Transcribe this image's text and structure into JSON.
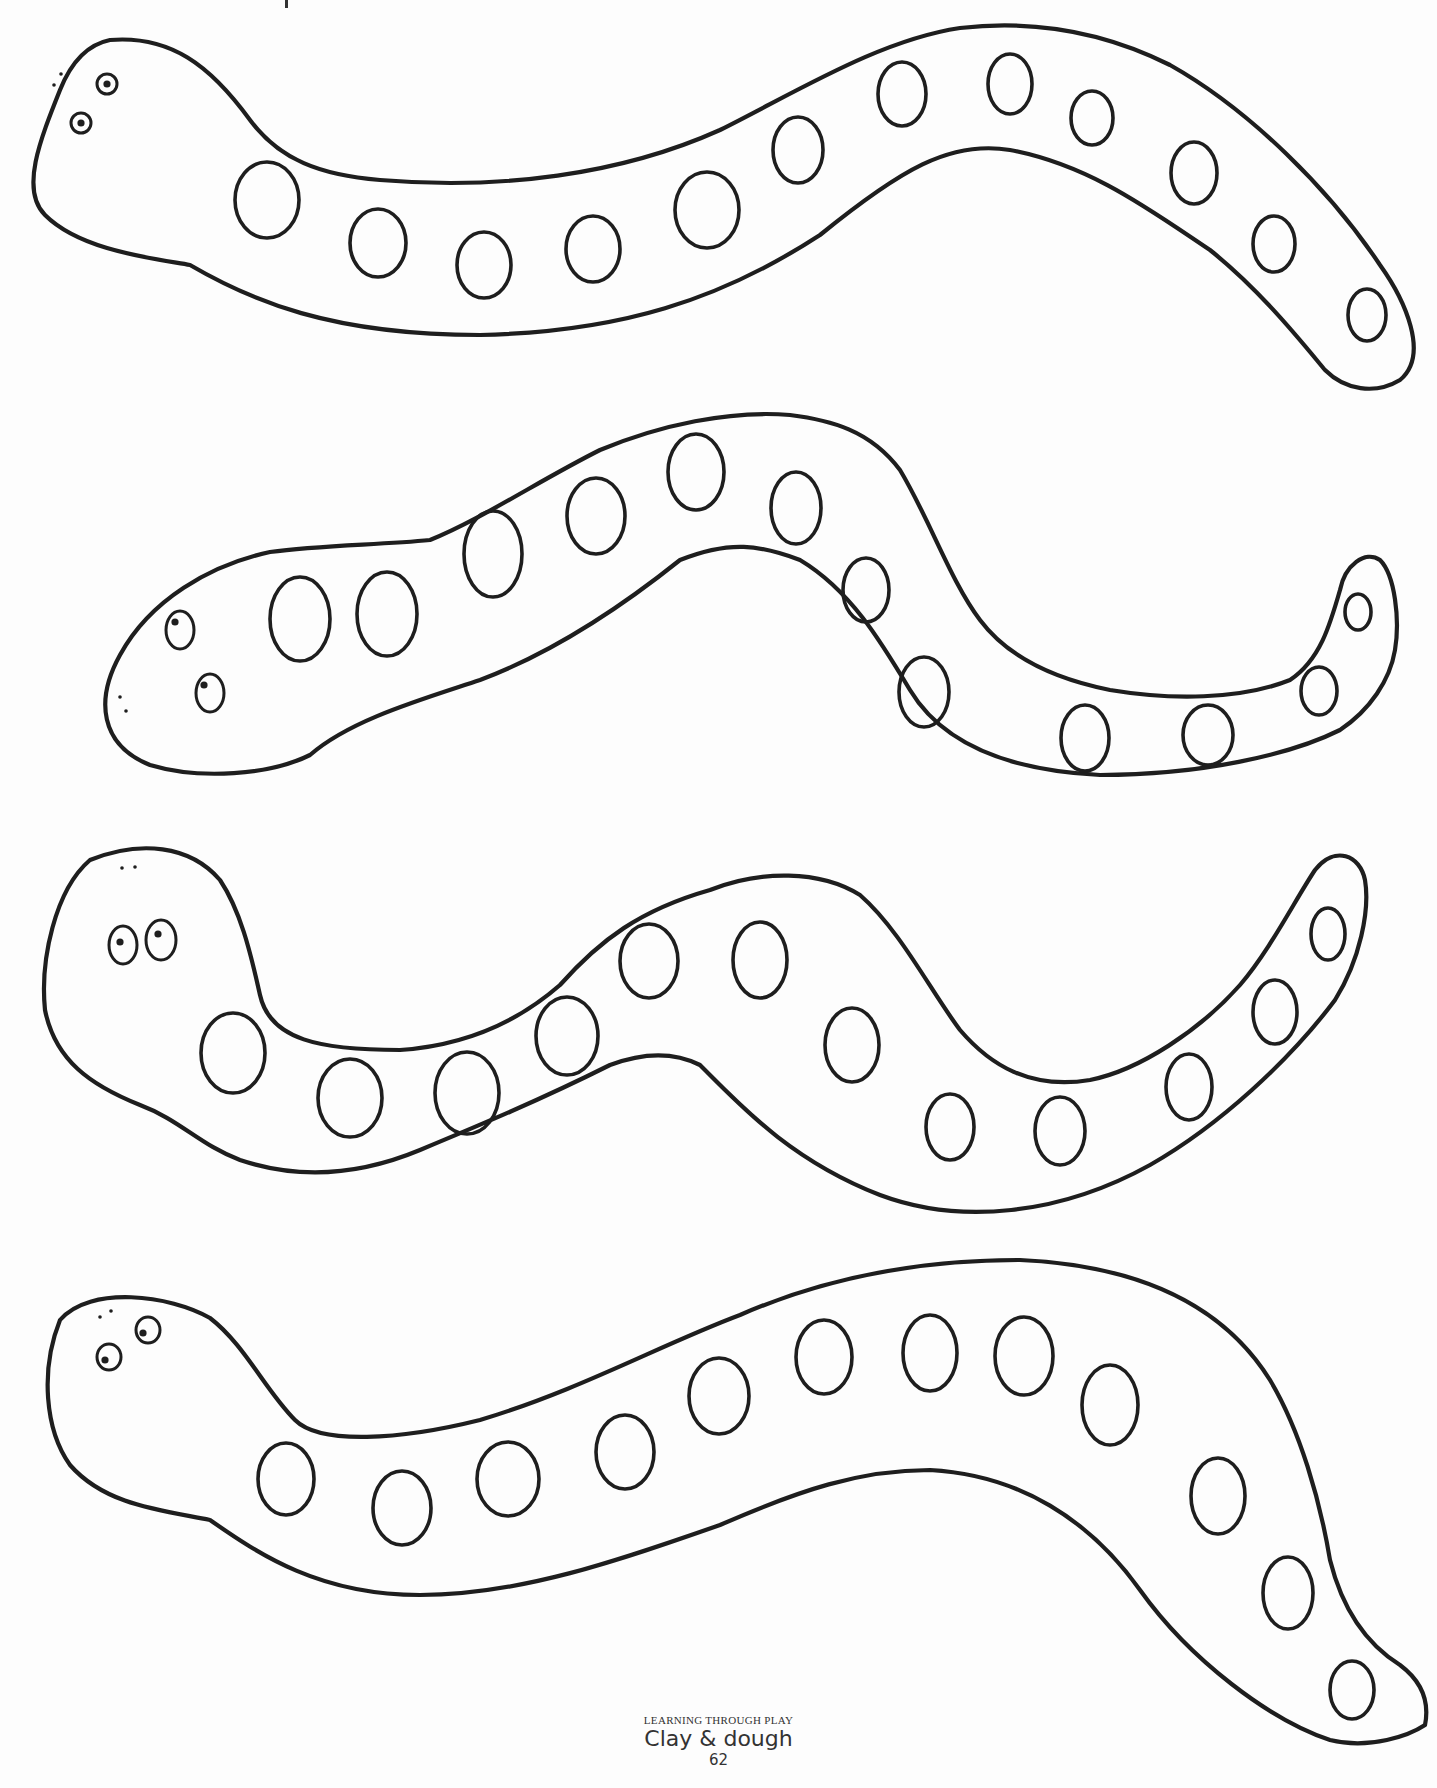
{
  "page": {
    "width": 1437,
    "height": 1788,
    "background": "#fdfdfd",
    "ink_color": "#1e1e1e"
  },
  "footer": {
    "series": "LEARNING THROUGH PLAY",
    "title": "Clay & dough",
    "page_number": "62"
  },
  "snakes": [
    {
      "id": "snake-1",
      "outline": "M 60 90 C 40 140, 20 190, 45 215 C 80 250, 150 258, 190 265 C 250 300, 330 335, 480 335 C 620 332, 720 300, 820 235 C 900 170, 950 140, 1010 150 C 1090 165, 1150 210, 1210 250 C 1260 290, 1300 340, 1325 370 C 1345 390, 1375 395, 1400 380 C 1430 355, 1405 300, 1380 265 C 1330 190, 1250 110, 1170 65 C 1100 30, 1030 20, 960 28 C 880 40, 800 90, 720 130 C 620 175, 500 190, 380 180 C 320 175, 280 160, 250 120 C 210 65, 170 35, 110 40 C 85 45, 70 65, 60 90 Z",
      "eyes": [
        {
          "cx": 107,
          "cy": 84,
          "rx": 10,
          "ry": 10,
          "pupil_dx": 0,
          "pupil_dy": 0
        },
        {
          "cx": 81,
          "cy": 123,
          "rx": 10,
          "ry": 10,
          "pupil_dx": 0,
          "pupil_dy": 0
        }
      ],
      "nostrils": [
        {
          "x": 61,
          "y": 74
        },
        {
          "x": 54,
          "y": 85
        }
      ],
      "spots": [
        {
          "cx": 267,
          "cy": 200,
          "rx": 32,
          "ry": 38
        },
        {
          "cx": 378,
          "cy": 243,
          "rx": 28,
          "ry": 34
        },
        {
          "cx": 484,
          "cy": 265,
          "rx": 27,
          "ry": 33
        },
        {
          "cx": 593,
          "cy": 249,
          "rx": 27,
          "ry": 33
        },
        {
          "cx": 707,
          "cy": 210,
          "rx": 32,
          "ry": 38
        },
        {
          "cx": 798,
          "cy": 150,
          "rx": 25,
          "ry": 33
        },
        {
          "cx": 902,
          "cy": 94,
          "rx": 24,
          "ry": 32
        },
        {
          "cx": 1010,
          "cy": 84,
          "rx": 22,
          "ry": 30
        },
        {
          "cx": 1092,
          "cy": 118,
          "rx": 21,
          "ry": 27
        },
        {
          "cx": 1194,
          "cy": 173,
          "rx": 23,
          "ry": 31
        },
        {
          "cx": 1274,
          "cy": 244,
          "rx": 21,
          "ry": 28
        },
        {
          "cx": 1367,
          "cy": 315,
          "rx": 19,
          "ry": 26
        }
      ]
    },
    {
      "id": "snake-2",
      "outline": "M 120 655 C 95 700, 100 745, 150 765 C 200 780, 270 775, 310 755 C 350 720, 420 700, 480 680 C 560 650, 630 600, 680 560 C 730 540, 760 545, 800 560 C 850 590, 880 640, 910 690 C 940 740, 1000 770, 1100 775 C 1200 775, 1290 755, 1340 730 C 1370 710, 1390 680, 1395 650 C 1400 620, 1395 575, 1380 560 C 1365 550, 1345 565, 1340 590 C 1330 625, 1320 660, 1290 680 C 1240 700, 1170 700, 1110 690 C 1060 680, 1010 660, 980 620 C 950 580, 930 520, 900 470 C 870 430, 830 420, 790 415 C 730 410, 660 425, 600 450 C 540 480, 480 520, 430 540 C 380 545, 320 545, 270 552 C 210 565, 150 600, 120 655 Z",
      "eyes": [
        {
          "cx": 180,
          "cy": 630,
          "rx": 14,
          "ry": 19,
          "pupil_dx": -5,
          "pupil_dy": -8
        },
        {
          "cx": 210,
          "cy": 693,
          "rx": 14,
          "ry": 19,
          "pupil_dx": -6,
          "pupil_dy": -8
        }
      ],
      "nostrils": [
        {
          "x": 120,
          "y": 697
        },
        {
          "x": 126,
          "y": 711
        }
      ],
      "spots": [
        {
          "cx": 300,
          "cy": 619,
          "rx": 30,
          "ry": 42
        },
        {
          "cx": 387,
          "cy": 614,
          "rx": 30,
          "ry": 42
        },
        {
          "cx": 493,
          "cy": 554,
          "rx": 29,
          "ry": 43
        },
        {
          "cx": 596,
          "cy": 516,
          "rx": 29,
          "ry": 38
        },
        {
          "cx": 696,
          "cy": 472,
          "rx": 28,
          "ry": 38
        },
        {
          "cx": 796,
          "cy": 508,
          "rx": 25,
          "ry": 36
        },
        {
          "cx": 866,
          "cy": 590,
          "rx": 23,
          "ry": 32
        },
        {
          "cx": 924,
          "cy": 692,
          "rx": 25,
          "ry": 35
        },
        {
          "cx": 1085,
          "cy": 738,
          "rx": 24,
          "ry": 33
        },
        {
          "cx": 1208,
          "cy": 735,
          "rx": 25,
          "ry": 30
        },
        {
          "cx": 1319,
          "cy": 691,
          "rx": 18,
          "ry": 24
        },
        {
          "cx": 1358,
          "cy": 612,
          "rx": 13,
          "ry": 18
        }
      ]
    },
    {
      "id": "snake-3",
      "outline": "M 90 860 C 55 890, 40 960, 45 1010 C 55 1060, 90 1085, 140 1105 C 180 1120, 200 1145, 240 1160 C 300 1180, 360 1175, 420 1150 C 480 1125, 540 1100, 610 1065 C 650 1050, 680 1055, 700 1065 C 740 1105, 790 1160, 880 1195 C 960 1225, 1060 1215, 1150 1165 C 1220 1125, 1290 1060, 1335 1000 C 1360 960, 1370 910, 1365 880 C 1360 855, 1335 845, 1315 870 C 1295 900, 1270 950, 1240 985 C 1200 1030, 1140 1070, 1090 1080 C 1030 1090, 990 1065, 960 1030 C 930 990, 900 930, 860 895 C 820 870, 760 870, 710 890 C 640 910, 600 940, 560 985 C 520 1020, 470 1045, 400 1050 C 320 1050, 270 1040, 260 995 C 250 950, 240 910, 220 880 C 190 845, 140 840, 90 860 Z",
      "eyes": [
        {
          "cx": 123,
          "cy": 945,
          "rx": 14,
          "ry": 19,
          "pupil_dx": -3,
          "pupil_dy": -3
        },
        {
          "cx": 161,
          "cy": 940,
          "rx": 15,
          "ry": 20,
          "pupil_dx": -3,
          "pupil_dy": -6
        }
      ],
      "nostrils": [
        {
          "x": 122,
          "y": 868
        },
        {
          "x": 135,
          "y": 867
        }
      ],
      "spots": [
        {
          "cx": 233,
          "cy": 1053,
          "rx": 32,
          "ry": 40
        },
        {
          "cx": 350,
          "cy": 1098,
          "rx": 32,
          "ry": 39
        },
        {
          "cx": 467,
          "cy": 1093,
          "rx": 32,
          "ry": 41
        },
        {
          "cx": 567,
          "cy": 1036,
          "rx": 31,
          "ry": 39
        },
        {
          "cx": 649,
          "cy": 961,
          "rx": 29,
          "ry": 37
        },
        {
          "cx": 760,
          "cy": 960,
          "rx": 27,
          "ry": 38
        },
        {
          "cx": 852,
          "cy": 1045,
          "rx": 27,
          "ry": 37
        },
        {
          "cx": 950,
          "cy": 1127,
          "rx": 24,
          "ry": 33
        },
        {
          "cx": 1060,
          "cy": 1131,
          "rx": 25,
          "ry": 34
        },
        {
          "cx": 1189,
          "cy": 1087,
          "rx": 23,
          "ry": 33
        },
        {
          "cx": 1275,
          "cy": 1012,
          "rx": 22,
          "ry": 32
        },
        {
          "cx": 1328,
          "cy": 934,
          "rx": 17,
          "ry": 26
        }
      ]
    },
    {
      "id": "snake-4",
      "outline": "M 60 1320 C 40 1370, 45 1430, 70 1465 C 105 1505, 160 1510, 210 1520 C 260 1555, 320 1595, 420 1595 C 520 1595, 620 1560, 720 1525 C 800 1490, 860 1470, 930 1470 C 1020 1475, 1090 1520, 1140 1590 C 1190 1660, 1270 1720, 1330 1740 C 1370 1750, 1410 1735, 1425 1725 C 1430 1700, 1420 1680, 1400 1665 C 1360 1640, 1340 1600, 1330 1560 C 1320 1500, 1300 1430, 1270 1380 C 1220 1300, 1130 1265, 1020 1260 C 910 1260, 820 1280, 740 1315 C 660 1345, 580 1390, 480 1420 C 400 1440, 320 1445, 295 1420 C 265 1390, 245 1345, 210 1318 C 170 1295, 90 1285, 60 1320 Z",
      "eyes": [
        {
          "cx": 148,
          "cy": 1330,
          "rx": 12,
          "ry": 13,
          "pupil_dx": -5,
          "pupil_dy": 3
        },
        {
          "cx": 109,
          "cy": 1357,
          "rx": 12,
          "ry": 13,
          "pupil_dx": -4,
          "pupil_dy": 3
        }
      ],
      "nostrils": [
        {
          "x": 100,
          "y": 1317
        },
        {
          "x": 111,
          "y": 1311
        }
      ],
      "spots": [
        {
          "cx": 286,
          "cy": 1479,
          "rx": 28,
          "ry": 36
        },
        {
          "cx": 402,
          "cy": 1508,
          "rx": 29,
          "ry": 37
        },
        {
          "cx": 508,
          "cy": 1479,
          "rx": 31,
          "ry": 37
        },
        {
          "cx": 625,
          "cy": 1452,
          "rx": 29,
          "ry": 37
        },
        {
          "cx": 719,
          "cy": 1396,
          "rx": 30,
          "ry": 38
        },
        {
          "cx": 824,
          "cy": 1357,
          "rx": 28,
          "ry": 37
        },
        {
          "cx": 930,
          "cy": 1353,
          "rx": 27,
          "ry": 38
        },
        {
          "cx": 1024,
          "cy": 1356,
          "rx": 29,
          "ry": 39
        },
        {
          "cx": 1110,
          "cy": 1405,
          "rx": 28,
          "ry": 40
        },
        {
          "cx": 1218,
          "cy": 1496,
          "rx": 27,
          "ry": 38
        },
        {
          "cx": 1288,
          "cy": 1593,
          "rx": 25,
          "ry": 36
        },
        {
          "cx": 1352,
          "cy": 1690,
          "rx": 22,
          "ry": 29
        }
      ]
    }
  ],
  "top_fragment": {
    "x": 285,
    "y": 0,
    "w": 3,
    "h": 8
  }
}
